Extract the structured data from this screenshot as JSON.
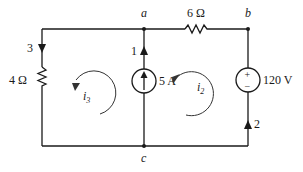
{
  "diagram": {
    "type": "circuit",
    "nodes": {
      "a": "a",
      "b": "b",
      "c": "c"
    },
    "components": {
      "resistor_top": {
        "label": "6 Ω"
      },
      "resistor_left": {
        "label": "4 Ω"
      },
      "current_source": {
        "label": "5 A"
      },
      "voltage_source": {
        "label": "120 V",
        "plus": "+",
        "minus": "−"
      }
    },
    "branch_currents": {
      "left": "3",
      "middle": "1",
      "right": "2"
    },
    "mesh_currents": {
      "left": {
        "symbol": "i",
        "subscript": "3"
      },
      "right": {
        "symbol": "i",
        "subscript": "2"
      }
    }
  }
}
